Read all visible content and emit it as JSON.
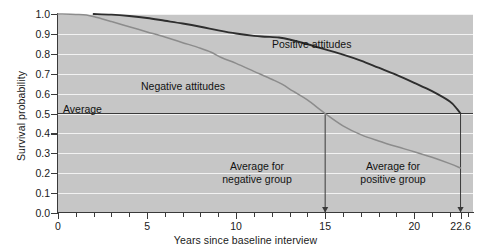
{
  "chart_data": {
    "type": "line",
    "title": "",
    "xlabel": "Years since baseline interview",
    "ylabel": "Survival probability",
    "xlim": [
      0,
      23.3
    ],
    "ylim": [
      0,
      1.0
    ],
    "grid": true,
    "legend_position": "inline-labels",
    "x_ticks": [
      0,
      5,
      10,
      15,
      20,
      22.6
    ],
    "x_tick_labels": [
      "0",
      "5",
      "10",
      "15",
      "20",
      "22.6"
    ],
    "x_minor_tick_interval": 1,
    "y_ticks": [
      0.0,
      0.1,
      0.2,
      0.3,
      0.4,
      0.5,
      0.6,
      0.7,
      0.8,
      0.9,
      1.0
    ],
    "y_tick_labels": [
      "0.0",
      "0.1",
      "0.2",
      "0.3",
      "0.4",
      "0.5",
      "0.6",
      "0.7",
      "0.8",
      "0.9",
      "1.0"
    ],
    "series": [
      {
        "name": "Positive attitudes",
        "color": "#2e2e2e",
        "width": 1.9,
        "median_survival_years": 22.6,
        "points": [
          [
            2.0,
            1.0
          ],
          [
            3.0,
            0.997
          ],
          [
            4.0,
            0.99
          ],
          [
            5.0,
            0.98
          ],
          [
            6.0,
            0.966
          ],
          [
            7.0,
            0.952
          ],
          [
            8.0,
            0.936
          ],
          [
            9.0,
            0.918
          ],
          [
            10.0,
            0.902
          ],
          [
            11.0,
            0.89
          ],
          [
            11.6,
            0.886
          ],
          [
            12.4,
            0.882
          ],
          [
            13.0,
            0.872
          ],
          [
            14.0,
            0.848
          ],
          [
            15.0,
            0.822
          ],
          [
            16.0,
            0.796
          ],
          [
            17.0,
            0.766
          ],
          [
            18.0,
            0.73
          ],
          [
            19.0,
            0.694
          ],
          [
            20.0,
            0.654
          ],
          [
            21.0,
            0.612
          ],
          [
            22.0,
            0.56
          ],
          [
            22.4,
            0.523
          ],
          [
            22.6,
            0.5
          ]
        ]
      },
      {
        "name": "Negative attitudes",
        "color": "#8c8c8c",
        "width": 1.5,
        "median_survival_years": 15.0,
        "points": [
          [
            0.0,
            1.0
          ],
          [
            1.0,
            0.998
          ],
          [
            1.6,
            0.995
          ],
          [
            2.2,
            0.982
          ],
          [
            3.0,
            0.962
          ],
          [
            4.0,
            0.936
          ],
          [
            5.0,
            0.91
          ],
          [
            6.0,
            0.884
          ],
          [
            7.0,
            0.856
          ],
          [
            8.0,
            0.828
          ],
          [
            8.6,
            0.808
          ],
          [
            9.2,
            0.78
          ],
          [
            10.0,
            0.752
          ],
          [
            11.0,
            0.712
          ],
          [
            12.0,
            0.672
          ],
          [
            12.6,
            0.646
          ],
          [
            13.2,
            0.612
          ],
          [
            14.0,
            0.568
          ],
          [
            15.0,
            0.5
          ],
          [
            16.0,
            0.438
          ],
          [
            17.0,
            0.394
          ],
          [
            18.0,
            0.362
          ],
          [
            19.0,
            0.334
          ],
          [
            20.0,
            0.308
          ],
          [
            21.0,
            0.28
          ],
          [
            22.0,
            0.248
          ],
          [
            22.6,
            0.226
          ]
        ]
      }
    ],
    "reference_lines": [
      {
        "name": "average-line",
        "orientation": "horizontal",
        "value": 0.5,
        "label": "Average",
        "color": "#3a3a3a"
      },
      {
        "name": "negative-group-dropline",
        "orientation": "vertical",
        "value": 15.0,
        "from_y": 0.5,
        "to_y": 0.0,
        "arrow": true,
        "label": "Average for negative group"
      },
      {
        "name": "positive-group-dropline",
        "orientation": "vertical",
        "value": 22.6,
        "from_y": 0.5,
        "to_y": 0.0,
        "arrow": true,
        "label": "Average for positive group"
      }
    ],
    "annotations": [
      {
        "name": "average",
        "text": "Average",
        "x": 0.3,
        "y": 0.545
      },
      {
        "name": "positive-attitudes",
        "text": "Positive attitudes",
        "x": 12.3,
        "y": 0.865
      },
      {
        "name": "negative-attitudes",
        "text": "Negative attitudes",
        "x": 5.1,
        "y": 0.655
      },
      {
        "name": "average-for-negative-group",
        "line1": "Average for",
        "line2": "negative group",
        "x": 11.3,
        "y": 0.27
      },
      {
        "name": "average-for-positive-group",
        "line1": "Average for",
        "line2": "positive group",
        "x": 19.0,
        "y": 0.27
      }
    ],
    "colors": {
      "panel_background": "#c6c6c6",
      "gridline": "#f2f2f2",
      "axis": "#3a3a3a",
      "positive_series": "#2e2e2e",
      "negative_series": "#8c8c8c",
      "text": "#1a1a1a"
    }
  },
  "axes": {
    "y_title": "Survival probability",
    "x_title": "Years since baseline interview",
    "y_tick_labels": [
      "1.0",
      "0.9",
      "0.8",
      "0.7",
      "0.6",
      "0.5",
      "0.4",
      "0.3",
      "0.2",
      "0.1",
      "0.0"
    ],
    "x_tick_labels": [
      "0",
      "5",
      "10",
      "15",
      "20",
      "22.6"
    ]
  },
  "labels": {
    "average": "Average",
    "positive_attitudes": "Positive attitudes",
    "negative_attitudes": "Negative attitudes",
    "avg_negative_line1": "Average for",
    "avg_negative_line2": "negative group",
    "avg_positive_line1": "Average for",
    "avg_positive_line2": "positive group"
  }
}
